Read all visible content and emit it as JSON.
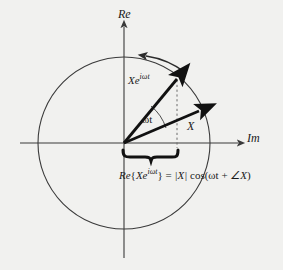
{
  "figure": {
    "background_color": "#f1f1ef",
    "stroke_color": "#3a3a3a",
    "vector_color": "#111111"
  },
  "axes": {
    "vertical": {
      "label": "Re",
      "name": "real-axis",
      "direction": "up"
    },
    "horizontal": {
      "label": "Im",
      "name": "imaginary-axis",
      "direction": "right"
    },
    "origin": {
      "x": 124,
      "y": 143
    }
  },
  "circle": {
    "center_x": 124,
    "center_y": 143,
    "radius": 86,
    "rotation_arrow": "counterclockwise"
  },
  "vectors": [
    {
      "name": "rotating-phasor",
      "label": "Xe",
      "label_exponent": "iωt",
      "label_full": "Xe^{iωt}",
      "tip_x": 178,
      "tip_y": 76
    },
    {
      "name": "static-phasor",
      "label": "X",
      "tip_x": 200,
      "tip_y": 110
    }
  ],
  "angle": {
    "name": "omega-t-angle",
    "label": "ωt"
  },
  "projection": {
    "name": "real-part-projection",
    "dashed_line_x": 177,
    "brace_left": 123,
    "brace_right": 178
  },
  "equation": {
    "prefix": "Re",
    "brace_open": "{",
    "operand": "Xe",
    "operand_exponent": "iωt",
    "brace_close": "}",
    "equals": " = ",
    "magnitude": "|X|",
    "cos": " cos(",
    "argument": "ωt",
    "plus": " + ",
    "angle_sym": "∠X",
    "close": ")",
    "full_text": "Re{Xe^{iωt}} = |X| cos(ωt + ∠X)"
  }
}
